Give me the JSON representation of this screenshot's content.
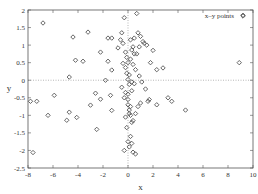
{
  "chart_data": {
    "type": "scatter",
    "title": "",
    "xlabel": "x",
    "ylabel": "y",
    "xlim": [
      -8,
      10
    ],
    "ylim": [
      -2.5,
      2
    ],
    "xticks": [
      -8,
      -6,
      -4,
      -2,
      0,
      2,
      4,
      6,
      8,
      10
    ],
    "xtick_labels": [
      "-8",
      "-6",
      "-4",
      "-2",
      "0",
      "2",
      "4",
      "6",
      "8",
      "10"
    ],
    "yticks": [
      -2.5,
      -2,
      -1.5,
      -1,
      -0.5,
      0,
      0.5,
      1,
      1.5,
      2
    ],
    "ytick_labels": [
      "-2.5",
      "-2",
      "-1.5",
      "-1",
      "-0.5",
      "0",
      "0.5",
      "1",
      "1.5",
      "2"
    ],
    "grid": false,
    "zero_lines": true,
    "legend": {
      "position": "top-right",
      "entries": [
        "x–y points"
      ]
    },
    "marker": "diamond",
    "marker_color": "#555555",
    "series": [
      {
        "name": "x–y points",
        "x": [
          -6.8,
          -4.4,
          -3.2,
          -4.2,
          -3.6,
          -4.7,
          -5.9,
          -7.8,
          -7.3,
          -6.4,
          -4.7,
          -4.9,
          -4.1,
          -7.6,
          -2.2,
          -1.6,
          -1.3,
          -1.6,
          -1.3,
          -1.8,
          -2.6,
          -2.5,
          -3.0,
          -2.2,
          -1.4,
          -1.3,
          -0.3,
          -0.5,
          -0.6,
          -0.8,
          -0.4,
          -0.2,
          -0.1,
          0.0,
          0.1,
          0.2,
          0.3,
          -0.5,
          -0.3,
          0.0,
          0.2,
          0.1,
          -0.2,
          0.3,
          -0.1,
          0.0,
          0.1,
          -0.3,
          0.5,
          0.8,
          1.0,
          1.2,
          1.5,
          0.7,
          0.9,
          1.3,
          1.8,
          2.0,
          2.3,
          2.8,
          3.2,
          3.5,
          0.4,
          0.6,
          0.9,
          1.1,
          1.4,
          1.7,
          0.3,
          0.5,
          -0.2,
          0.0,
          0.1,
          0.2,
          0.4,
          0.6,
          0.8,
          1.0,
          0.0,
          0.2,
          0.3,
          0.4,
          0.6,
          1.6,
          2.3,
          4.6,
          8.9,
          9.2,
          -0.4,
          -0.1,
          0.1,
          0.3,
          0.0,
          -0.2,
          0.2,
          0.4,
          0.5,
          0.7
        ],
        "y": [
          1.63,
          1.23,
          1.37,
          0.57,
          0.54,
          0.09,
          -0.43,
          -0.6,
          -0.6,
          -1.0,
          -0.91,
          -1.14,
          -1.06,
          -2.06,
          0.8,
          1.2,
          1.2,
          0.54,
          0.29,
          0.0,
          -0.37,
          -1.4,
          -0.71,
          -0.54,
          -0.43,
          -0.86,
          1.78,
          1.35,
          1.15,
          0.92,
          0.48,
          0.36,
          0.2,
          0.02,
          -0.12,
          0.6,
          0.86,
          -0.2,
          -0.5,
          -0.7,
          -0.75,
          -0.95,
          -1.05,
          -1.2,
          -1.35,
          -1.75,
          -1.9,
          -2.0,
          1.2,
          1.35,
          1.25,
          1.1,
          1.0,
          0.75,
          0.95,
          1.05,
          0.5,
          0.85,
          0.3,
          0.35,
          -0.5,
          -0.6,
          0.45,
          0.3,
          0.12,
          -0.05,
          -0.25,
          -0.55,
          -0.3,
          -0.1,
          -0.35,
          -0.55,
          -0.85,
          -1.0,
          -1.15,
          -0.95,
          -0.75,
          -0.65,
          -0.4,
          -1.6,
          -1.8,
          -2.05,
          -2.1,
          -0.6,
          -0.7,
          -0.85,
          0.5,
          1.85,
          1.05,
          0.65,
          0.15,
          -0.05,
          0.5,
          0.8,
          1.15,
          0.95,
          0.75,
          1.9
        ]
      }
    ]
  }
}
